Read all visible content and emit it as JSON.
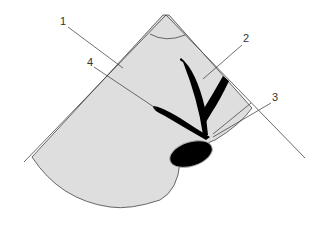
{
  "diagram": {
    "type": "ultrasound-sector-schematic",
    "colors": {
      "background": "#ffffff",
      "sector_fill": "#dedede",
      "outline": "#444444",
      "anechoic": "#000000",
      "leader": "#333333"
    },
    "labels": [
      {
        "id": "1",
        "text": "1"
      },
      {
        "id": "2",
        "text": "2"
      },
      {
        "id": "3",
        "text": "3"
      },
      {
        "id": "4",
        "text": "4"
      }
    ]
  }
}
